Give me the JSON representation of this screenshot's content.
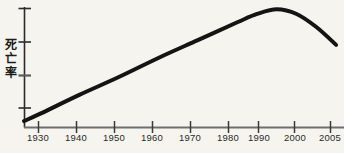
{
  "chart_data": {
    "type": "line",
    "title": "",
    "xlabel": "",
    "ylabel": "死亡率",
    "ylabel_chars": [
      "死",
      "亡",
      "率"
    ],
    "x_tick_labels": [
      "1930",
      "1940",
      "1950",
      "1960",
      "1970",
      "1980",
      "1990",
      "2000",
      "2005"
    ],
    "x_tick_values": [
      1930,
      1940,
      1950,
      1960,
      1970,
      1980,
      1990,
      2000,
      2005
    ],
    "y_tick_labels": [
      "",
      "",
      "",
      ""
    ],
    "y_tick_count": 4,
    "xlim": [
      1926,
      2007
    ],
    "ylim": [
      0,
      100
    ],
    "grid": false,
    "legend": false,
    "series": [
      {
        "name": "死亡率",
        "color": "#141414",
        "x": [
          1926,
          1930,
          1940,
          1950,
          1960,
          1970,
          1980,
          1985,
          1990,
          1995,
          2000,
          2005
        ],
        "values": [
          5,
          11,
          27,
          42,
          58,
          73,
          88,
          95,
          99,
          95,
          84,
          69
        ]
      }
    ],
    "annotations": []
  },
  "axes": {
    "axis_color": "#6e6e6e",
    "yaxis_color": "#2a2a2a",
    "background": "#f6f4ef",
    "line_color": "#141414",
    "line_width": 4
  }
}
